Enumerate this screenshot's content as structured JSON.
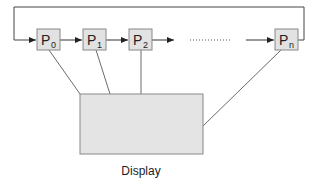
{
  "diagram": {
    "processors": [
      {
        "id": "p0",
        "main": "P",
        "sub": "0"
      },
      {
        "id": "p1",
        "main": "P",
        "sub": "1"
      },
      {
        "id": "p2",
        "main": "P",
        "sub": "2"
      },
      {
        "id": "pn",
        "main": "P",
        "sub": "n"
      }
    ],
    "display": {
      "label": "Display"
    },
    "ellipsis": "..........",
    "colors": {
      "box_fill": "#e2e2e2",
      "box_stroke": "#888888",
      "line": "#333333",
      "display_fill": "#e4e4e4"
    }
  }
}
